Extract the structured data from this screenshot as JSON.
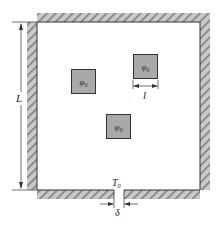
{
  "diagram": {
    "labels": {
      "length": "L",
      "square_size": "l",
      "temperature": "T₀",
      "gap": "δ"
    },
    "sources": [
      {
        "label": "φ₀",
        "x": 71,
        "y": 69
      },
      {
        "label": "φ₀",
        "x": 133,
        "y": 54
      },
      {
        "label": "φ₀",
        "x": 106,
        "y": 114
      }
    ],
    "colors": {
      "wall_hatch": "#8c8c8c",
      "source_fill": "#a9a9a9",
      "outline": "#333333"
    }
  }
}
